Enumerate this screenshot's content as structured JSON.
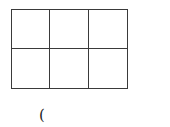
{
  "diagram": {
    "type": "grid",
    "rows": 2,
    "columns": 3,
    "line_color": "#3a3a3a",
    "cells": [
      [
        "",
        "",
        ""
      ],
      [
        "",
        "",
        ""
      ]
    ]
  },
  "caption": {
    "text": "("
  }
}
